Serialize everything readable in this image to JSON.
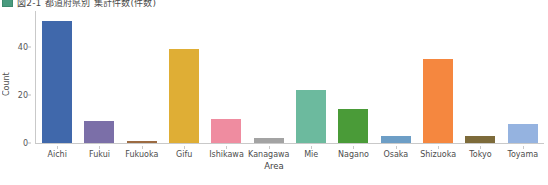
{
  "title": {
    "swatch_color": "#4a9b7f",
    "text": "図2-1 都道府県別 集計件数(件数)"
  },
  "chart_data": {
    "type": "bar",
    "title": "図2-1 都道府県別 集計件数(件数)",
    "xlabel": "Area",
    "ylabel": "Count",
    "categories": [
      "Aichi",
      "Fukui",
      "Fukuoka",
      "Gifu",
      "Ishikawa",
      "Kanagawa",
      "Mie",
      "Nagano",
      "Osaka",
      "Shizuoka",
      "Tokyo",
      "Toyama"
    ],
    "values": [
      51,
      9,
      1,
      39,
      10,
      2,
      22,
      14,
      3,
      35,
      3,
      8
    ],
    "colors": [
      "#4068ab",
      "#7b6fa8",
      "#9c6b42",
      "#dfae35",
      "#ef8ca0",
      "#a3a3a3",
      "#6cba9e",
      "#4a9b38",
      "#6d9ec6",
      "#f5873f",
      "#7d6b3a",
      "#95b3e0"
    ],
    "ylim": [
      0,
      55
    ],
    "yticks": [
      0,
      20,
      40
    ],
    "ytick_labels": [
      "0",
      "20",
      "40"
    ],
    "grid": false,
    "legend": "none"
  }
}
